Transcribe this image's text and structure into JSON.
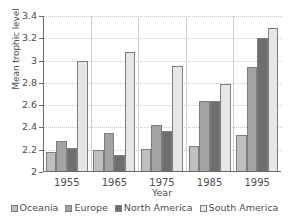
{
  "chart_data": {
    "type": "bar",
    "title": "",
    "subtitle": "",
    "xlabel": "Year",
    "ylabel": "Mean trophic level",
    "categories": [
      "1955",
      "1965",
      "1975",
      "1985",
      "1995"
    ],
    "series": [
      {
        "name": "Oceania",
        "color": "#bfbfbf",
        "values": [
          2.18,
          2.2,
          2.21,
          2.23,
          2.33
        ]
      },
      {
        "name": "Europe",
        "color": "#a3a3a3",
        "values": [
          2.28,
          2.35,
          2.42,
          2.64,
          2.94
        ]
      },
      {
        "name": "North America",
        "color": "#6e6e6e",
        "values": [
          2.22,
          2.15,
          2.37,
          2.64,
          3.2
        ]
      },
      {
        "name": "South America",
        "color": "#e6e6e6",
        "values": [
          3.0,
          3.08,
          2.95,
          2.79,
          3.29
        ]
      }
    ],
    "ylim": [
      2,
      3.4
    ],
    "ytick_labels": [
      "2",
      "2.2",
      "2.4",
      "2.6",
      "2.8",
      "3",
      "3.2",
      "3.4"
    ],
    "ytick_values": [
      2,
      2.2,
      2.4,
      2.6,
      2.8,
      3.0,
      3.2,
      3.4
    ],
    "grid": true,
    "grid_axis": "y",
    "legend_position": "bottom",
    "bar_border_color": "#7d7d7d",
    "axis_color": "#6b6b6b",
    "gridline_color": "#c9c9c9"
  }
}
